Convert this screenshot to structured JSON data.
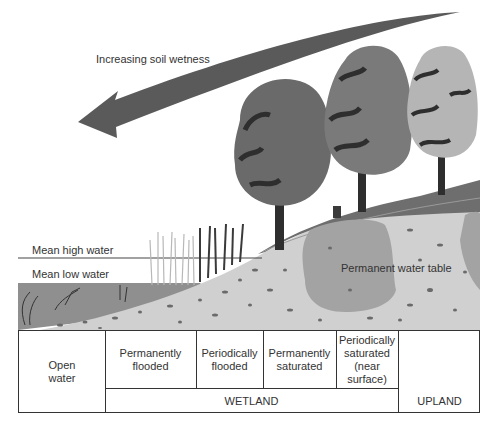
{
  "diagram": {
    "arrow_label": "Increasing soil wetness",
    "water_levels": {
      "mean_high": "Mean high water",
      "mean_low": "Mean low water"
    },
    "soil_label": "Permanent water table",
    "zones": [
      {
        "label": "Open water"
      },
      {
        "label": "Permanently flooded"
      },
      {
        "label": "Periodically flooded"
      },
      {
        "label": "Permanently saturated"
      },
      {
        "label": "Periodically saturated (near surface)"
      },
      {
        "label": ""
      }
    ],
    "zone_lines": {
      "open_water_1": "Open",
      "open_water_2": "water",
      "perm_flooded_1": "Permanently",
      "perm_flooded_2": "flooded",
      "per_flooded_1": "Periodically",
      "per_flooded_2": "flooded",
      "perm_sat_1": "Permanently",
      "perm_sat_2": "saturated",
      "per_sat_1": "Periodically",
      "per_sat_2": "saturated",
      "per_sat_3": "(near",
      "per_sat_4": "surface)"
    },
    "categories": {
      "wetland": "WETLAND",
      "upland": "UPLAND"
    },
    "colors": {
      "arrow": "#5a5a5a",
      "water": "#8f8f8f",
      "soil": "#cfcfcf",
      "water_table": "#a3a3a3",
      "topsoil": "#6e6e6e",
      "tree_dark": "#4a4a4a",
      "tree_mid": "#777777",
      "tree_light": "#b5b5b5"
    }
  }
}
